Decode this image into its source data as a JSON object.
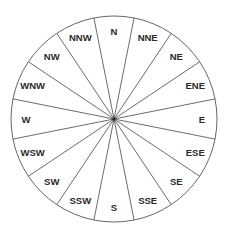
{
  "diagram": {
    "center": [
      114,
      119
    ],
    "radius": 103,
    "label_radius": 88,
    "line_color": "#5a5a5a",
    "text_color": "#2a2a2a",
    "directions": [
      {
        "label": "N",
        "angle": 0
      },
      {
        "label": "NNE",
        "angle": 22.5
      },
      {
        "label": "NE",
        "angle": 45
      },
      {
        "label": "ENE",
        "angle": 67.5
      },
      {
        "label": "E",
        "angle": 90
      },
      {
        "label": "ESE",
        "angle": 112.5
      },
      {
        "label": "SE",
        "angle": 135
      },
      {
        "label": "SSE",
        "angle": 157.5
      },
      {
        "label": "S",
        "angle": 180
      },
      {
        "label": "SSW",
        "angle": 202.5
      },
      {
        "label": "SW",
        "angle": 225
      },
      {
        "label": "WSW",
        "angle": 247.5
      },
      {
        "label": "W",
        "angle": 270
      },
      {
        "label": "WNW",
        "angle": 292.5
      },
      {
        "label": "NW",
        "angle": 315
      },
      {
        "label": "NNW",
        "angle": 337.5
      }
    ]
  }
}
